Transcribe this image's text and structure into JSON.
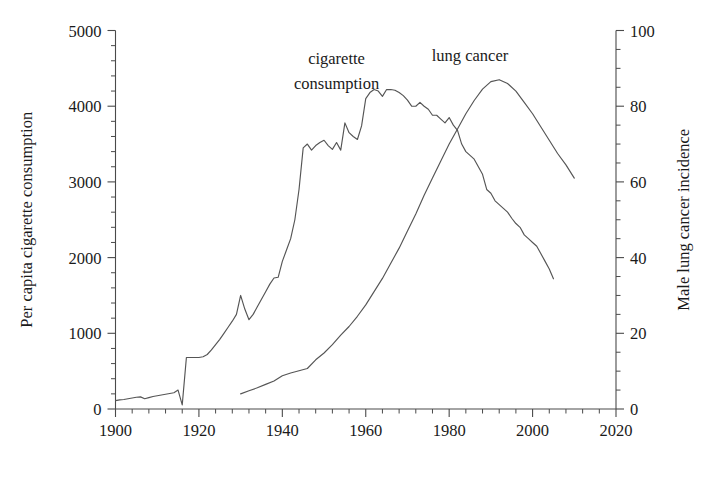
{
  "chart_data": {
    "type": "line",
    "title": "",
    "subtitle": "",
    "xlabel": "",
    "ylabel": "Per capita cigarette consumption",
    "y2label": "Male lung cancer incidence",
    "xlim": [
      1900,
      2020
    ],
    "ylim": [
      0,
      5000
    ],
    "y2lim": [
      0,
      100
    ],
    "grid": false,
    "legend_position": "inline-annotations",
    "x_ticks": [
      1900,
      1920,
      1940,
      1960,
      1980,
      2000,
      2020
    ],
    "x_tick_labels": [
      "1900",
      "1920",
      "1940",
      "1960",
      "1980",
      "2000",
      "2020"
    ],
    "x_minor_tick_step": 4,
    "y_ticks": [
      0,
      1000,
      2000,
      3000,
      4000,
      5000
    ],
    "y_tick_labels": [
      "0",
      "1000",
      "2000",
      "3000",
      "4000",
      "5000"
    ],
    "y_minor_tick_step": 200,
    "y2_ticks": [
      0,
      20,
      40,
      60,
      80,
      100
    ],
    "y2_tick_labels": [
      "0",
      "20",
      "40",
      "60",
      "80",
      "100"
    ],
    "y2_minor_tick_step": 5,
    "annotations": [
      {
        "text": "cigarette",
        "x": 1953,
        "y": 4560,
        "series": "cigarette-consumption"
      },
      {
        "text": "consumption",
        "x": 1953,
        "y": 4230,
        "series": "cigarette-consumption"
      },
      {
        "text": "lung cancer",
        "x": 1985,
        "y": 4600,
        "series": "lung-cancer"
      }
    ],
    "series": [
      {
        "name": "cigarette consumption",
        "axis": "left",
        "units": "cigarettes per capita per year",
        "x": [
          1900,
          1901,
          1902,
          1903,
          1904,
          1905,
          1906,
          1907,
          1908,
          1909,
          1910,
          1911,
          1912,
          1913,
          1914,
          1915,
          1916,
          1917,
          1918,
          1919,
          1920,
          1921,
          1922,
          1923,
          1924,
          1925,
          1926,
          1927,
          1928,
          1929,
          1930,
          1931,
          1932,
          1933,
          1934,
          1935,
          1936,
          1937,
          1938,
          1939,
          1940,
          1941,
          1942,
          1943,
          1944,
          1945,
          1946,
          1947,
          1948,
          1949,
          1950,
          1951,
          1952,
          1953,
          1954,
          1955,
          1956,
          1957,
          1958,
          1959,
          1960,
          1961,
          1962,
          1963,
          1964,
          1965,
          1966,
          1967,
          1968,
          1969,
          1970,
          1971,
          1972,
          1973,
          1974,
          1975,
          1976,
          1977,
          1978,
          1979,
          1980,
          1981,
          1982,
          1983,
          1984,
          1985,
          1986,
          1987,
          1988,
          1989,
          1990,
          1991,
          1992,
          1993,
          1994,
          1995,
          1996,
          1997,
          1998,
          1999,
          2000,
          2001,
          2002,
          2003,
          2004,
          2005
        ],
        "values": [
          110,
          120,
          125,
          135,
          145,
          155,
          160,
          135,
          150,
          165,
          175,
          185,
          195,
          205,
          215,
          250,
          55,
          680,
          680,
          680,
          680,
          690,
          720,
          780,
          850,
          920,
          1000,
          1080,
          1160,
          1250,
          1500,
          1320,
          1180,
          1250,
          1350,
          1450,
          1550,
          1650,
          1730,
          1740,
          1950,
          2100,
          2250,
          2500,
          2900,
          3450,
          3500,
          3420,
          3480,
          3520,
          3550,
          3480,
          3430,
          3520,
          3420,
          3780,
          3650,
          3600,
          3560,
          3740,
          4100,
          4180,
          4220,
          4200,
          4130,
          4220,
          4220,
          4210,
          4180,
          4140,
          4080,
          4000,
          4000,
          4050,
          4000,
          3960,
          3880,
          3880,
          3830,
          3780,
          3850,
          3750,
          3680,
          3500,
          3400,
          3350,
          3300,
          3200,
          3100,
          2900,
          2850,
          2750,
          2700,
          2650,
          2600,
          2520,
          2450,
          2400,
          2300,
          2250,
          2200,
          2150,
          2050,
          1950,
          1850,
          1720
        ]
      },
      {
        "name": "lung cancer",
        "axis": "right",
        "units": "male lung cancer incidence per 100,000",
        "x": [
          1930,
          1932,
          1934,
          1936,
          1938,
          1940,
          1942,
          1944,
          1946,
          1948,
          1950,
          1952,
          1954,
          1956,
          1958,
          1960,
          1962,
          1964,
          1966,
          1968,
          1970,
          1972,
          1974,
          1976,
          1978,
          1980,
          1982,
          1984,
          1986,
          1988,
          1990,
          1992,
          1994,
          1996,
          1998,
          2000,
          2002,
          2004,
          2006,
          2008,
          2010
        ],
        "values": [
          4.0,
          4.8,
          5.6,
          6.5,
          7.4,
          8.8,
          9.5,
          10.1,
          10.7,
          13.0,
          14.8,
          17.0,
          19.5,
          21.8,
          24.5,
          27.5,
          31.0,
          34.5,
          38.5,
          42.5,
          47.0,
          51.5,
          56.5,
          61.0,
          65.5,
          70.0,
          74.0,
          78.0,
          81.5,
          84.5,
          86.5,
          87.0,
          86.0,
          84.0,
          81.0,
          78.0,
          74.5,
          71.0,
          67.5,
          64.5,
          61.0
        ]
      }
    ]
  },
  "figure": {
    "background_color": "#ffffff",
    "line_color": "#555555",
    "axis_color": "#4a4a4a",
    "text_color": "#1a1a1a"
  }
}
